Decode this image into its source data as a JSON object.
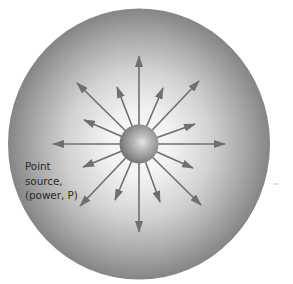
{
  "diagram": {
    "label": {
      "lines": [
        "Point",
        "source,",
        "(power, P)"
      ]
    },
    "colors": {
      "sphere_edge": "#858585",
      "sphere_mid": "#c4c4c4",
      "sphere_center": "#fafafa",
      "arrow": "#6f6f6f",
      "source_highlight": "#e2e2e2",
      "source_edge": "#6e6e6e",
      "text": "#2a2a2a"
    },
    "outer_sphere": {
      "cx": 139,
      "cy": 144,
      "rx": 131,
      "ry": 135.5
    },
    "point_source": {
      "cx": 139,
      "cy": 144,
      "r": 19.5
    },
    "arrow_tips": [
      {
        "name": "up",
        "x": 139,
        "y": 56
      },
      {
        "name": "up-left-long",
        "x": 77,
        "y": 83
      },
      {
        "name": "up-left-short",
        "x": 117,
        "y": 87
      },
      {
        "name": "up-right-short",
        "x": 163,
        "y": 88
      },
      {
        "name": "up-right-long",
        "x": 199,
        "y": 81
      },
      {
        "name": "left-up-short",
        "x": 84,
        "y": 120
      },
      {
        "name": "right-up-short",
        "x": 195,
        "y": 124
      },
      {
        "name": "left",
        "x": 53,
        "y": 144
      },
      {
        "name": "right",
        "x": 225,
        "y": 144
      },
      {
        "name": "left-down-short",
        "x": 83,
        "y": 167
      },
      {
        "name": "right-down-short",
        "x": 193,
        "y": 168
      },
      {
        "name": "down-left-long",
        "x": 80,
        "y": 206
      },
      {
        "name": "down-left-short",
        "x": 115,
        "y": 200
      },
      {
        "name": "down",
        "x": 139,
        "y": 232
      },
      {
        "name": "down-right-short",
        "x": 160,
        "y": 202
      },
      {
        "name": "down-right-long",
        "x": 201,
        "y": 205
      }
    ]
  }
}
